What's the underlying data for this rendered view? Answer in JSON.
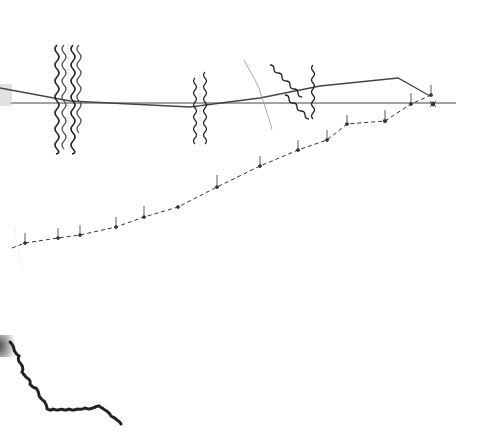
{
  "figure": {
    "colors": {
      "background": "#ffffff",
      "ink": "#222222",
      "light_ink": "#9a9a9a",
      "dashed": "#333333"
    },
    "horizontal_line": {
      "x1": 10,
      "y1": 103,
      "x2": 456,
      "y2": 103
    },
    "solid_polyline": [
      [
        0,
        88
      ],
      [
        70,
        101
      ],
      [
        190,
        107
      ],
      [
        260,
        98
      ],
      [
        320,
        86
      ],
      [
        398,
        78
      ],
      [
        430,
        96
      ]
    ],
    "dashed_polyline": [
      [
        12,
        248
      ],
      [
        25,
        243
      ],
      [
        58,
        238
      ],
      [
        80,
        235
      ],
      [
        116,
        227
      ],
      [
        144,
        217
      ],
      [
        178,
        207
      ],
      [
        217,
        187
      ],
      [
        260,
        166
      ],
      [
        298,
        150
      ],
      [
        327,
        140
      ],
      [
        347,
        124
      ],
      [
        385,
        121
      ],
      [
        411,
        104
      ],
      [
        431,
        95
      ]
    ],
    "dashed_markers": [
      [
        25,
        243
      ],
      [
        58,
        238
      ],
      [
        80,
        235
      ],
      [
        116,
        227
      ],
      [
        144,
        217
      ],
      [
        178,
        207
      ],
      [
        217,
        187
      ],
      [
        260,
        166
      ],
      [
        298,
        150
      ],
      [
        327,
        140
      ],
      [
        347,
        124
      ],
      [
        385,
        121
      ],
      [
        411,
        104
      ],
      [
        431,
        95
      ]
    ],
    "helix_bundles": [
      {
        "id": "left-double-helix",
        "x": 58,
        "y_top": 45,
        "y_bottom": 150
      },
      {
        "id": "left-double-helix-b",
        "x": 73,
        "y_top": 45,
        "y_bottom": 150
      },
      {
        "id": "middle-helix-a",
        "x": 194,
        "y_top": 75,
        "y_bottom": 145
      },
      {
        "id": "middle-helix-b",
        "x": 204,
        "y_top": 70,
        "y_bottom": 145
      }
    ],
    "lower_chain": [
      [
        8,
        345
      ],
      [
        14,
        352
      ],
      [
        18,
        362
      ],
      [
        22,
        375
      ],
      [
        26,
        385
      ],
      [
        36,
        392
      ],
      [
        43,
        400
      ],
      [
        48,
        410
      ],
      [
        70,
        412
      ],
      [
        90,
        410
      ],
      [
        100,
        408
      ],
      [
        110,
        416
      ],
      [
        124,
        426
      ]
    ]
  }
}
